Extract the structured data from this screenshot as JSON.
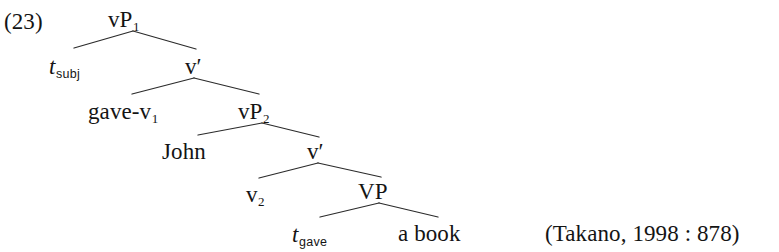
{
  "example": {
    "number": "(23)"
  },
  "citation": {
    "text": "(Takano, 1998 : 878)"
  },
  "tree": {
    "type": "syntax-tree",
    "description": "X-bar phrase structure tree for a double-object construction with verb raising",
    "nodes": [
      {
        "id": "vp1",
        "base": "vP",
        "sub": "1",
        "sub_style": "serif",
        "x": 133,
        "y": 20
      },
      {
        "id": "tsubj",
        "base": "t",
        "sub": "subj",
        "sub_style": "sans",
        "x": 72,
        "y": 67
      },
      {
        "id": "vbar1",
        "base": "v",
        "prime": "′",
        "x": 194,
        "y": 67
      },
      {
        "id": "gave-v1",
        "base": "gave-v",
        "sub": "1",
        "sub_style": "serif",
        "x": 130,
        "y": 112
      },
      {
        "id": "vp2",
        "base": "vP",
        "sub": "2",
        "sub_style": "serif",
        "x": 262,
        "y": 112
      },
      {
        "id": "john",
        "base": "John",
        "x": 196,
        "y": 152
      },
      {
        "id": "vbar2",
        "base": "v",
        "prime": "′",
        "x": 316,
        "y": 152
      },
      {
        "id": "v2",
        "base": "v",
        "sub": "2",
        "sub_style": "serif",
        "x": 258,
        "y": 194
      },
      {
        "id": "vp",
        "base": "VP",
        "x": 379,
        "y": 192
      },
      {
        "id": "tgave",
        "base": "t",
        "sub": "gave",
        "sub_style": "sans",
        "x": 317,
        "y": 235
      },
      {
        "id": "abook",
        "base": "a book",
        "x": 434,
        "y": 234
      }
    ],
    "edges": [
      {
        "from": "vp1",
        "to": "tsubj",
        "x1": 133,
        "y1": 31,
        "x2": 74,
        "y2": 48
      },
      {
        "from": "vp1",
        "to": "vbar1",
        "x1": 133,
        "y1": 31,
        "x2": 196,
        "y2": 49
      },
      {
        "from": "vbar1",
        "to": "gave-v1",
        "x1": 194,
        "y1": 78,
        "x2": 132,
        "y2": 94
      },
      {
        "from": "vbar1",
        "to": "vp2",
        "x1": 194,
        "y1": 78,
        "x2": 259,
        "y2": 94
      },
      {
        "from": "vp2",
        "to": "john",
        "x1": 262,
        "y1": 123,
        "x2": 198,
        "y2": 135
      },
      {
        "from": "vp2",
        "to": "vbar2",
        "x1": 262,
        "y1": 123,
        "x2": 319,
        "y2": 137
      },
      {
        "from": "vbar2",
        "to": "v2",
        "x1": 318,
        "y1": 163,
        "x2": 259,
        "y2": 178
      },
      {
        "from": "vbar2",
        "to": "vp",
        "x1": 318,
        "y1": 163,
        "x2": 381,
        "y2": 177
      },
      {
        "from": "vp",
        "to": "tgave",
        "x1": 379,
        "y1": 203,
        "x2": 320,
        "y2": 217
      },
      {
        "from": "vp",
        "to": "abook",
        "x1": 379,
        "y1": 203,
        "x2": 438,
        "y2": 217
      }
    ],
    "colors": {
      "line": "#2b2b2b",
      "text": "#141414",
      "background": "#ffffff"
    }
  }
}
